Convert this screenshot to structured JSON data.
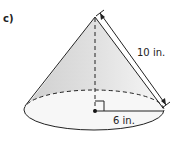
{
  "figure": {
    "part_label": "c)",
    "shape": "cone",
    "slant_height_label": "10 in.",
    "radius_label": "6 in.",
    "colors": {
      "shade_left": "#d6d6d6",
      "shade_right": "#f4f4f4",
      "base_fill": "#f7f7f7",
      "stroke": "#222222"
    }
  }
}
